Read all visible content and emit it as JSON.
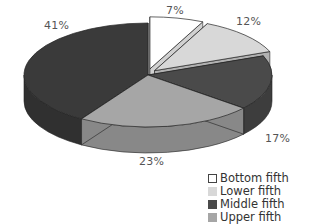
{
  "chart_data": {
    "type": "pie",
    "variant": "3d-exploded",
    "title": "",
    "categories": [
      "Bottom fifth",
      "Lower fifth",
      "Middle fifth",
      "Upper fifth",
      "Top slice (unlabeled)"
    ],
    "values": [
      7,
      12,
      17,
      23,
      41
    ],
    "value_labels": [
      "7%",
      "12%",
      "17%",
      "23%",
      "41%"
    ],
    "slice_colors": [
      "#ffffff",
      "#d8d8d8",
      "#4a4a4a",
      "#a6a6a6",
      "#3a3a3a"
    ],
    "exploded": [
      true,
      true,
      false,
      false,
      false
    ],
    "legend": {
      "position": "bottom-right",
      "entries": [
        {
          "label": "Bottom fifth",
          "color": "#ffffff"
        },
        {
          "label": "Lower fifth",
          "color": "#d8d8d8"
        },
        {
          "label": "Middle fifth",
          "color": "#4a4a4a"
        },
        {
          "label": "Upper fifth",
          "color": "#a6a6a6"
        }
      ]
    }
  },
  "labels": {
    "p7": "7%",
    "p12": "12%",
    "p17": "17%",
    "p23": "23%",
    "p41": "41%"
  },
  "legend": [
    {
      "label": "Bottom fifth",
      "color": "#ffffff"
    },
    {
      "label": "Lower fifth",
      "color": "#d8d8d8"
    },
    {
      "label": "Middle fifth",
      "color": "#4a4a4a"
    },
    {
      "label": "Upper fifth",
      "color": "#a6a6a6"
    }
  ]
}
